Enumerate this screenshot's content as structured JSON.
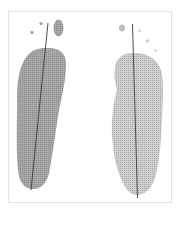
{
  "figure": {
    "colors": {
      "background": "#ffffff",
      "frame": "#e2e2e2",
      "left_print": "#9a9a9a",
      "right_print": "#bdbdbd",
      "axis_line": "#3a3a3a"
    },
    "prints": [
      {
        "side": "left",
        "label": "left-footprint"
      },
      {
        "side": "right",
        "label": "right-footprint"
      }
    ]
  }
}
